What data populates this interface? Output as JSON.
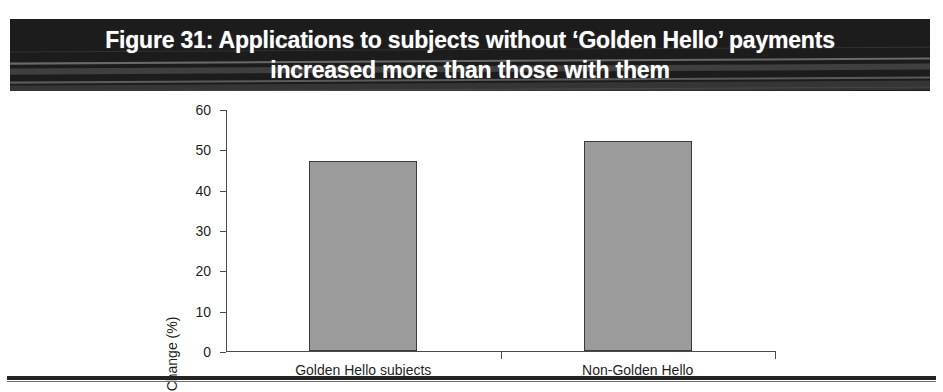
{
  "figure": {
    "title_line_1": "Figure 31: Applications to subjects without ‘Golden Hello’ payments",
    "title_line_2": "increased more than those with them",
    "title_background_color": "#1c1c1c",
    "title_text_color": "#ffffff"
  },
  "chart_data": {
    "type": "bar",
    "title": "Figure 31: Applications to subjects without ‘Golden Hello’ payments increased more than those with them",
    "categories": [
      "Golden Hello subjects",
      "Non-Golden Hello"
    ],
    "values": [
      47,
      52
    ],
    "xlabel": "",
    "ylabel": "Change (%)",
    "ylim": [
      0,
      60
    ],
    "yticks": [
      0,
      10,
      20,
      30,
      40,
      50,
      60
    ],
    "ytick_labels": [
      "0",
      "10",
      "20",
      "30",
      "40",
      "50",
      "60"
    ],
    "grid": false,
    "legend": false,
    "bar_fill_color": "#9b9b9b",
    "bar_edge_color": "#3a3a3a",
    "axis_color": "#4a4a4a"
  }
}
